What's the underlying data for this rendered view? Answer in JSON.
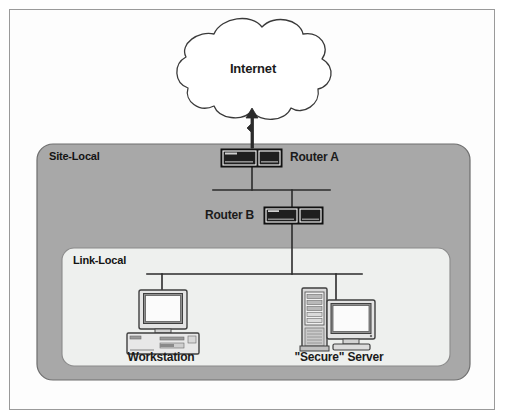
{
  "figure": {
    "background_color": "#ffffff",
    "frame_border_color": "#9a9a9a"
  },
  "cloud": {
    "label": "Internet",
    "fill": "#ffffff",
    "stroke": "#3a3a3a"
  },
  "zones": [
    {
      "id": "site-local",
      "label": "Site-Local",
      "fill": "#a8a8a8",
      "stroke": "#6e6e6e"
    },
    {
      "id": "link-local",
      "label": "Link-Local",
      "fill": "#eef0ee",
      "stroke": "#8a8a8a"
    }
  ],
  "nodes": {
    "router_a": {
      "label": "Router A",
      "icon": "router-icon"
    },
    "router_b": {
      "label": "Router B",
      "icon": "router-icon"
    },
    "workstation": {
      "label": "Workstation",
      "icon": "desktop-computer-icon"
    },
    "server": {
      "label": "\"Secure\" Server",
      "icon": "tower-server-icon"
    }
  },
  "links": {
    "internet_uplink": {
      "from": "router_a",
      "to": "Internet",
      "style": "arrow-up"
    },
    "site_bus": {
      "connects": [
        "router_a",
        "router_b"
      ],
      "style": "bus-line"
    },
    "link_bus": {
      "connects": [
        "router_b",
        "workstation",
        "server"
      ],
      "style": "bus-line"
    }
  },
  "colors": {
    "line": "#2b2b2b",
    "router_body": "#1c1c1c",
    "router_highlight": "#ffffff",
    "device_outline": "#4a4a4a",
    "device_fill": "#e8e8e8",
    "screen_fill": "#fbfbfb"
  }
}
